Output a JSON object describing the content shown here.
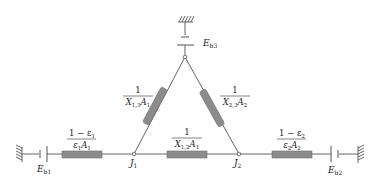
{
  "diagram": {
    "type": "radiation-network",
    "colors": {
      "wire": "#555555",
      "resistor_fill": "#8c8c8c",
      "resistor_stroke": "#6e6e6e",
      "text": "#222222",
      "background": "#ffffff"
    },
    "sources": {
      "eb1": {
        "symbol": "E",
        "sub": "b1"
      },
      "eb2": {
        "symbol": "E",
        "sub": "b2"
      },
      "eb3": {
        "symbol": "E",
        "sub": "b3"
      }
    },
    "nodes": {
      "j1": {
        "symbol": "J",
        "sub": "1"
      },
      "j2": {
        "symbol": "J",
        "sub": "2"
      }
    },
    "resistances": {
      "surface1": {
        "num": "1 − ε",
        "num_sub": "1",
        "den_a": "ε",
        "den_a_sub": "1",
        "den_b": "A",
        "den_b_sub": "1"
      },
      "surface2": {
        "num": "1 − ε",
        "num_sub": "2",
        "den_a": "ε",
        "den_a_sub": "2",
        "den_b": "A",
        "den_b_sub": "2"
      },
      "space12": {
        "num": "1",
        "den_a": "X",
        "den_a_sub": "1,2",
        "den_b": "A",
        "den_b_sub": "1"
      },
      "space13": {
        "num": "1",
        "den_a": "X",
        "den_a_sub": "1,3",
        "den_b": "A",
        "den_b_sub": "1"
      },
      "space23": {
        "num": "1",
        "den_a": "X",
        "den_a_sub": "2,3",
        "den_b": "A",
        "den_b_sub": "2"
      }
    }
  }
}
